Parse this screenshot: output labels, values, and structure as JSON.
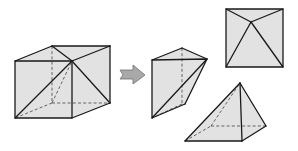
{
  "diagram": {
    "colors": {
      "face_fill": "#e2e2e2",
      "edge": "#1a1a1a",
      "hidden_edge": "#555555",
      "arrow_fill": "#a9a9a9"
    },
    "figures": [
      {
        "id": "cube",
        "label": "Cube with diagonal cuts"
      },
      {
        "id": "arrow",
        "label": "Transformation arrow"
      },
      {
        "id": "wedge",
        "label": "Wedge piece"
      },
      {
        "id": "top-view",
        "label": "Square pyramid top view"
      },
      {
        "id": "pyramid",
        "label": "Square pyramid"
      }
    ]
  }
}
